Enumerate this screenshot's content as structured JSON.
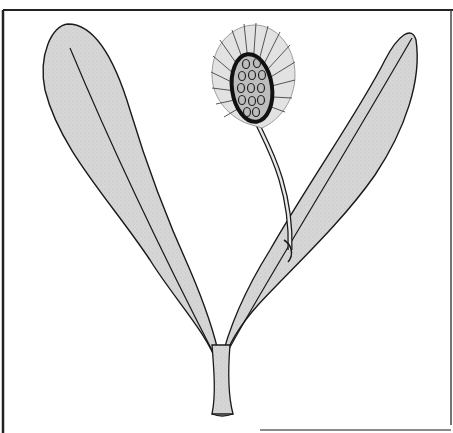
{
  "illustration": {
    "subject": "botanical-plant-drawing",
    "colors": {
      "background": "#ffffff",
      "leaf_fill": "#d4d4d4",
      "outline": "#1a1a1a",
      "frame": "#222222",
      "fan_fill": "#e0e0e0"
    }
  }
}
